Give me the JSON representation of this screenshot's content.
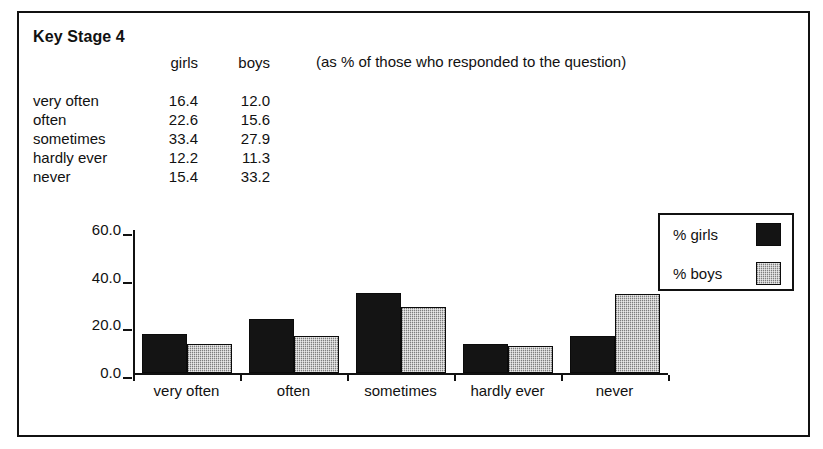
{
  "frame": {
    "border_color": "#111111"
  },
  "heading": {
    "title": "Key Stage 4"
  },
  "note": {
    "text": "(as % of those who responded to the question)"
  },
  "table": {
    "columns": [
      "",
      "girls",
      "boys"
    ],
    "rows": [
      {
        "label": "very often",
        "girls": "16.4",
        "boys": "12.0"
      },
      {
        "label": "often",
        "girls": "22.6",
        "boys": "15.6"
      },
      {
        "label": "sometimes",
        "girls": "33.4",
        "boys": "27.9"
      },
      {
        "label": "hardly ever",
        "girls": "12.2",
        "boys": "11.3"
      },
      {
        "label": "never",
        "girls": "15.4",
        "boys": "33.2"
      }
    ]
  },
  "legend": {
    "entries": [
      {
        "label": "% girls",
        "swatch": "black",
        "color": "#141414"
      },
      {
        "label": "% boys",
        "swatch": "hatched-gray",
        "color": "#b4b4b4"
      }
    ]
  },
  "chart_data": {
    "type": "bar",
    "title": "",
    "xlabel": "",
    "ylabel": "",
    "categories": [
      "very often",
      "often",
      "sometimes",
      "hardly ever",
      "never"
    ],
    "series": [
      {
        "name": "% girls",
        "values": [
          16.4,
          22.6,
          33.4,
          12.2,
          15.4
        ],
        "color": "#141414"
      },
      {
        "name": "% boys",
        "values": [
          12.0,
          15.6,
          27.9,
          11.3,
          33.2
        ],
        "color": "#b4b4b4"
      }
    ],
    "ylim": [
      0,
      60
    ],
    "ytick_labels": [
      "0.0",
      "20.0",
      "40.0",
      "60.0"
    ],
    "ytick_values": [
      0,
      20,
      40,
      60
    ],
    "grid": false,
    "legend_position": "top-right",
    "units": "percent"
  }
}
